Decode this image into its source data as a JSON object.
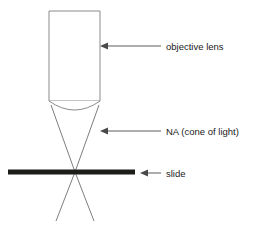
{
  "figure": {
    "background_color": "#ffffff"
  },
  "colors": {
    "barrel_stroke": "#8a8a8a",
    "ray_stroke": "#6e6e6e",
    "slide_color": "#1c1c18",
    "leader_color": "#4a4a4a",
    "text_color": "#1a1a1a"
  },
  "parts": {
    "objective_lens": {
      "label": "objective lens",
      "barrel": {
        "x": 49,
        "y": 11,
        "width": 51,
        "height": 90
      },
      "lens_curve_depth": 11
    },
    "numerical_aperture": {
      "label": "NA (cone of light)",
      "focal_point": {
        "x": 75,
        "y": 172
      },
      "cone_top_left": {
        "x": 51,
        "y": 107
      },
      "cone_top_right": {
        "x": 99,
        "y": 107
      },
      "cone_bottom_left": {
        "x": 56,
        "y": 220
      },
      "cone_bottom_right": {
        "x": 94,
        "y": 220
      }
    },
    "slide": {
      "label": "slide",
      "x1": 8,
      "x2": 135,
      "y": 172,
      "thickness": 5
    }
  },
  "annotations": [
    {
      "name": "objective-lens",
      "text": "objective lens",
      "text_x": 166,
      "text_y": 50,
      "arrow_tip_x": 100,
      "arrow_tail_x": 161,
      "arrow_y": 46
    },
    {
      "name": "numerical-aperture",
      "text": "NA (cone of light)",
      "text_x": 166,
      "text_y": 135,
      "arrow_tip_x": 100,
      "arrow_tail_x": 161,
      "arrow_y": 131
    },
    {
      "name": "slide",
      "text": "slide",
      "text_x": 166,
      "text_y": 177,
      "arrow_tip_x": 140,
      "arrow_tail_x": 161,
      "arrow_y": 173
    }
  ]
}
